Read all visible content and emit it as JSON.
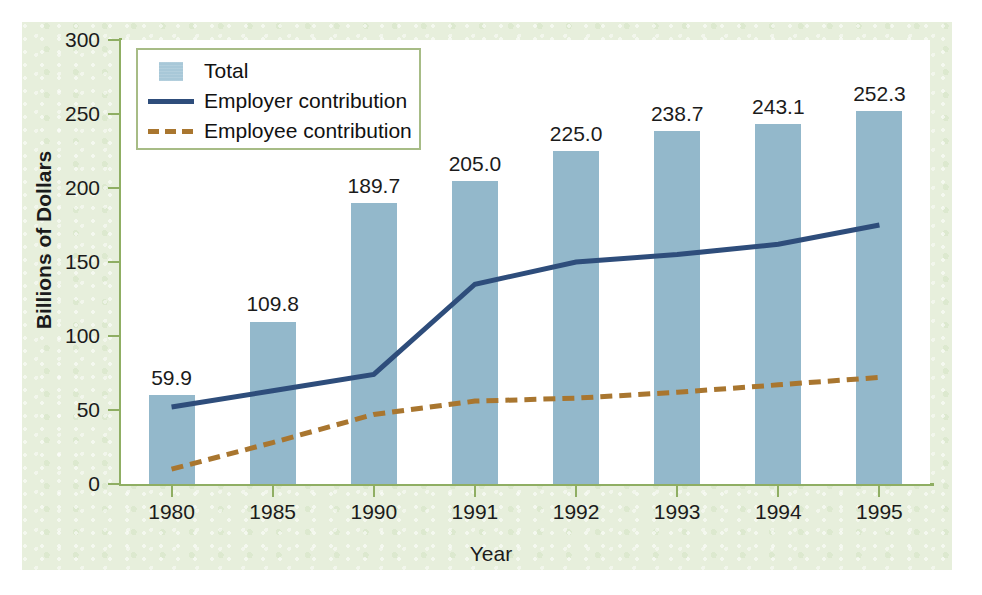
{
  "chart_data": {
    "type": "bar",
    "title": "",
    "xlabel": "Year",
    "ylabel": "Billions of Dollars",
    "categories": [
      "1980",
      "1985",
      "1990",
      "1991",
      "1992",
      "1993",
      "1994",
      "1995"
    ],
    "ylim": [
      0,
      300
    ],
    "yticks": [
      0,
      50,
      100,
      150,
      200,
      250,
      300
    ],
    "ytick_labels": [
      "0",
      "50",
      "100",
      "150",
      "200",
      "250",
      "300"
    ],
    "grid": false,
    "legend_position": "upper-left-inside",
    "bar_series": {
      "name": "Total",
      "values": [
        59.9,
        109.8,
        189.7,
        205.0,
        225.0,
        238.7,
        243.1,
        252.3
      ],
      "labels": [
        "59.9",
        "109.8",
        "189.7",
        "205.0",
        "225.0",
        "238.7",
        "243.1",
        "252.3"
      ],
      "color": "#93b8cb"
    },
    "series": [
      {
        "name": "Employer contribution",
        "style": "solid",
        "color": "#2e4d7b",
        "values": [
          52,
          63,
          74,
          135,
          150,
          155,
          162,
          175
        ]
      },
      {
        "name": "Employee contribution",
        "style": "dashed",
        "color": "#a9762f",
        "values": [
          10,
          28,
          47,
          56,
          58,
          62,
          67,
          72
        ]
      }
    ],
    "legend": [
      {
        "label": "Total",
        "key": "filled-square-swatch"
      },
      {
        "label": "Employer contribution",
        "key": "solid-line-swatch"
      },
      {
        "label": "Employee contribution",
        "key": "dashed-line-swatch"
      }
    ]
  },
  "colors": {
    "panel_background": "#e7efdc",
    "plot_background": "#ffffff",
    "axis": "#8fae63",
    "bar": "#93b8cb",
    "employer_line": "#2e4d7b",
    "employee_line": "#a9762f",
    "legend_border": "#a7bc86",
    "text": "#1b1b1b"
  }
}
